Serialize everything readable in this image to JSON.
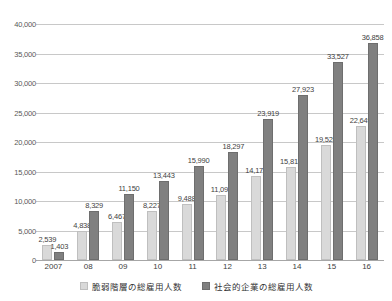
{
  "chart_data": {
    "type": "bar",
    "title": "",
    "subtitle": "",
    "xlabel": "",
    "ylabel": "",
    "ylim": [
      0,
      40000
    ],
    "ytick_labels": [
      "0",
      "5,000",
      "10,000",
      "15,000",
      "20,000",
      "25,000",
      "30,000",
      "35,000",
      "40,000"
    ],
    "ytick_values": [
      0,
      5000,
      10000,
      15000,
      20000,
      25000,
      30000,
      35000,
      40000
    ],
    "grid": true,
    "legend_position": "bottom",
    "categories": [
      "2007",
      "08",
      "09",
      "10",
      "11",
      "12",
      "13",
      "14",
      "15",
      "16"
    ],
    "series": [
      {
        "name": "脆弱階層の総雇用人数",
        "color": "#d9d9d9",
        "values": [
          2539,
          4838,
          6467,
          8227,
          9488,
          11094,
          14178,
          15815,
          19528,
          22649
        ],
        "labels": [
          "2,539",
          "4,838",
          "6,467",
          "8,227",
          "9,488",
          "11,094",
          "14,178",
          "15,815",
          "19,528",
          "22,649"
        ]
      },
      {
        "name": "社会的企業の総雇用人数",
        "color": "#808080",
        "values": [
          1403,
          8329,
          11150,
          13443,
          15990,
          18297,
          23919,
          27923,
          33527,
          36858
        ],
        "labels": [
          "1,403",
          "8,329",
          "11,150",
          "13,443",
          "15,990",
          "18,297",
          "23,919",
          "27,923",
          "33,527",
          "36,858"
        ]
      }
    ]
  },
  "legend": {
    "items": [
      {
        "label": "脆弱階層の総雇用人数",
        "swatch": "light"
      },
      {
        "label": "社会的企業の総雇用人数",
        "swatch": "dark"
      }
    ]
  },
  "colors": {
    "series_light": "#d9d9d9",
    "series_dark": "#808080",
    "gridline": "#c8c8c8",
    "axis": "#a6a6a6",
    "label_text": "#3f3f3f",
    "tick_text": "#595959",
    "background": "#ffffff"
  }
}
